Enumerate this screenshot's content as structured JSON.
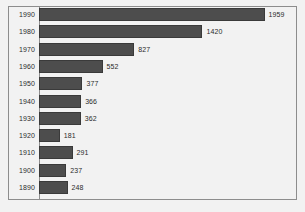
{
  "chart_data": {
    "type": "bar",
    "orientation": "horizontal",
    "title": "",
    "subtitle": "",
    "xlabel": "",
    "ylabel": "",
    "categories": [
      "1990",
      "1980",
      "1970",
      "1960",
      "1950",
      "1940",
      "1930",
      "1920",
      "1910",
      "1900",
      "1890"
    ],
    "values": [
      1959,
      1420,
      827,
      552,
      377,
      366,
      362,
      181,
      291,
      237,
      248
    ],
    "value_labels": [
      "1959",
      "1420",
      "827",
      "552",
      "377",
      "366",
      "362",
      "181",
      "291",
      "237",
      "248"
    ],
    "xlim": [
      0,
      2180
    ],
    "grid": false,
    "legend": null,
    "bar_color": "#4d4d4d",
    "bar_edge_color": "#3a3a3a",
    "plot_background": "#f2f2f2",
    "frame_color": "#8d8d8d",
    "text_color": "#2b2b2b"
  }
}
